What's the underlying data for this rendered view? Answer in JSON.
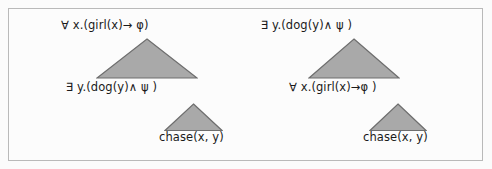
{
  "figure": {
    "background_color": "#fcfcfc",
    "border_color": "#b9b9b9",
    "triangle_fill": "#a9a9a9",
    "triangle_stroke": "#6e6e6e",
    "text_color": "#1a1a1a"
  },
  "trees": [
    {
      "id": "left",
      "nodes": [
        {
          "id": "top",
          "label": "∀ x.(girl(x)→ φ)"
        },
        {
          "id": "mid",
          "label": "∃ y.(dog(y)∧ ψ )"
        },
        {
          "id": "leaf",
          "label": "chase(x, y)"
        }
      ]
    },
    {
      "id": "right",
      "nodes": [
        {
          "id": "top",
          "label": "∃ y.(dog(y)∧  ψ )"
        },
        {
          "id": "mid",
          "label": "∀ x.(girl(x)→φ )"
        },
        {
          "id": "leaf",
          "label": "chase(x, y)"
        }
      ]
    }
  ]
}
